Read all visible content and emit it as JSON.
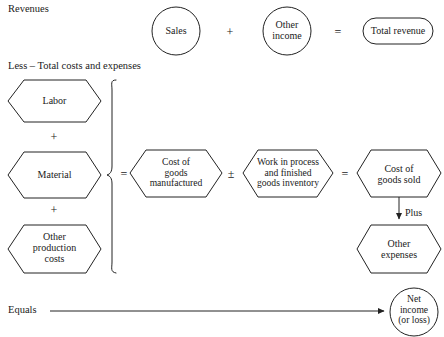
{
  "diagram": {
    "stroke_color": "#222222",
    "text_color": "#1a1a1a",
    "background": "#ffffff",
    "sections": {
      "revenues_label": "Revenues",
      "less_label": "Less – Total costs and expenses",
      "equals_label": "Equals"
    },
    "nodes": {
      "sales": {
        "label": "Sales",
        "shape": "circle"
      },
      "other_income": {
        "label": "Other\nincome",
        "shape": "circle"
      },
      "total_revenue": {
        "label": "Total revenue",
        "shape": "rounded-rect"
      },
      "labor": {
        "label": "Labor",
        "shape": "hexagon"
      },
      "material": {
        "label": "Material",
        "shape": "hexagon"
      },
      "other_production_costs": {
        "label": "Other\nproduction\ncosts",
        "shape": "hexagon"
      },
      "cost_of_goods_manufactured": {
        "label": "Cost of\ngoods\nmanufactured",
        "shape": "hexagon"
      },
      "work_in_process": {
        "label": "Work in process\nand finished\ngoods inventory",
        "shape": "hexagon"
      },
      "cost_of_goods_sold": {
        "label": "Cost of\ngoods sold",
        "shape": "hexagon"
      },
      "other_expenses": {
        "label": "Other\nexpenses",
        "shape": "hexagon"
      },
      "net_income": {
        "label": "Net\nincome\n(or loss)",
        "shape": "circle"
      }
    },
    "operators": {
      "revenue_plus": "+",
      "revenue_equals": "=",
      "stack_plus_1": "+",
      "stack_plus_2": "+",
      "brace_equals": "=",
      "plus_minus": "±",
      "cogs_equals": "=",
      "plus_note": "Plus"
    }
  }
}
